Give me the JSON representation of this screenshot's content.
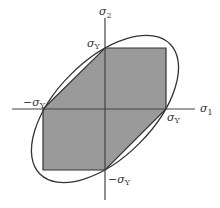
{
  "diagram": {
    "axes": {
      "x_label": "σ",
      "x_sub": "1",
      "y_label": "σ",
      "y_sub": "2"
    },
    "points": {
      "top": {
        "label": "σ",
        "sub": "Y"
      },
      "right": {
        "label": "σ",
        "sub": "Y"
      },
      "left": {
        "label": "−σ",
        "sub": "Y"
      },
      "bottom": {
        "label": "−σ",
        "sub": "Y"
      }
    },
    "colors": {
      "fill": "#9a9a9a",
      "stroke": "#333333",
      "axis": "#444444"
    },
    "regions": {
      "hexagon": "Tresca yield surface",
      "ellipse": "von Mises yield surface"
    }
  }
}
